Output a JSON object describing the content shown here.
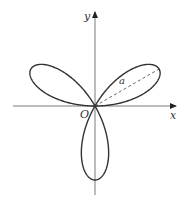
{
  "figure": {
    "type": "polar-curve",
    "equation": "r = a sin 3θ",
    "petal_count": 3,
    "petal_directions_deg": [
      30,
      150,
      270
    ],
    "labels": {
      "x_axis": "x",
      "y_axis": "y",
      "origin": "O",
      "radius": "a"
    },
    "colors": {
      "curve": "#333333",
      "axes": "#7a7a7a",
      "dashed": "#555555",
      "background": "#ffffff"
    }
  }
}
